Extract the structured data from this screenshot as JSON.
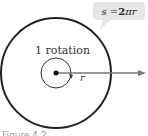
{
  "diagram": {
    "callout": {
      "s_part": "s = ",
      "bold_part": "2",
      "rest": "πr"
    },
    "inner_label": "1 rotation",
    "radius_label": "r",
    "caption": "Figure 4.2"
  },
  "colors": {
    "outer_circle": "#222222",
    "inner_circle": "#333333",
    "ray": "#777777",
    "callout_bg": "#e6e6e6"
  }
}
